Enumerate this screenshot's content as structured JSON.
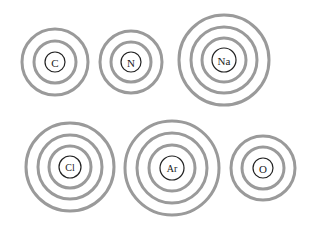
{
  "figure": {
    "background_color": "#ffffff",
    "width": 309,
    "height": 233
  },
  "style": {
    "shell_color": "#9a9a9a",
    "shell_stroke_width": 3,
    "nucleus_stroke_color": "#222222",
    "nucleus_stroke_width": 1.2,
    "nucleus_fill": "#ffffff",
    "label_color": "#1a1a1a"
  },
  "atoms": [
    {
      "symbol": "C",
      "name": "carbon",
      "row": 1,
      "column": 1,
      "cx": 55,
      "cy": 62,
      "nucleus_radius": 10,
      "label_font_size": 11,
      "shell_count": 2,
      "shell_radii": [
        21,
        33
      ]
    },
    {
      "symbol": "N",
      "name": "nitrogen",
      "row": 1,
      "column": 2,
      "cx": 131,
      "cy": 62,
      "nucleus_radius": 10,
      "label_font_size": 11,
      "shell_count": 2,
      "shell_radii": [
        20,
        31
      ]
    },
    {
      "symbol": "Na",
      "name": "sodium",
      "row": 1,
      "column": 3,
      "cx": 224,
      "cy": 60,
      "nucleus_radius": 12,
      "label_font_size": 11,
      "shell_count": 3,
      "shell_radii": [
        22,
        33,
        45
      ]
    },
    {
      "symbol": "Cl",
      "name": "chlorine",
      "row": 2,
      "column": 1,
      "cx": 70,
      "cy": 167,
      "nucleus_radius": 11,
      "label_font_size": 10,
      "shell_count": 3,
      "shell_radii": [
        21,
        32,
        44
      ]
    },
    {
      "symbol": "Ar",
      "name": "argon",
      "row": 2,
      "column": 2,
      "cx": 172,
      "cy": 168,
      "nucleus_radius": 12,
      "label_font_size": 10,
      "shell_count": 3,
      "shell_radii": [
        23,
        35,
        47
      ]
    },
    {
      "symbol": "O",
      "name": "oxygen",
      "row": 2,
      "column": 3,
      "cx": 263,
      "cy": 168,
      "nucleus_radius": 10,
      "label_font_size": 11,
      "shell_count": 2,
      "shell_radii": [
        21,
        32
      ]
    }
  ]
}
